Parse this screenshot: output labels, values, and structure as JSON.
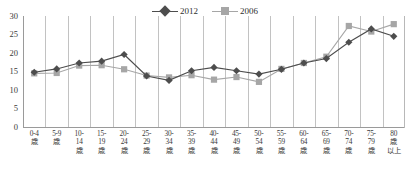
{
  "chart_data": {
    "type": "line",
    "title": "",
    "subtitle": "",
    "xlabel": "",
    "ylabel": "",
    "ylim": [
      0,
      30
    ],
    "yticks": [
      0,
      5,
      10,
      15,
      20,
      25,
      30
    ],
    "grid": "vertical",
    "legend_position": "top-center",
    "categories": [
      "0-4\n歳",
      "5-9\n歳",
      "10-\n14\n歳",
      "15-\n19\n歳",
      "20-\n24\n歳",
      "25-\n29\n歳",
      "30-\n34\n歳",
      "35-\n39\n歳",
      "40-\n44\n歳",
      "45-\n49\n歳",
      "50-\n54\n歳",
      "55-\n59\n歳",
      "60-\n64\n歳",
      "65-\n69\n歳",
      "70-\n74\n歳",
      "75-\n79\n歳",
      "80\n歳\n以上"
    ],
    "category_lines": [
      [
        "0-4",
        "歳"
      ],
      [
        "5-9",
        "歳"
      ],
      [
        "10-",
        "14",
        "歳"
      ],
      [
        "15-",
        "19",
        "歳"
      ],
      [
        "20-",
        "24",
        "歳"
      ],
      [
        "25-",
        "29",
        "歳"
      ],
      [
        "30-",
        "34",
        "歳"
      ],
      [
        "35-",
        "39",
        "歳"
      ],
      [
        "40-",
        "44",
        "歳"
      ],
      [
        "45-",
        "49",
        "歳"
      ],
      [
        "50-",
        "54",
        "歳"
      ],
      [
        "55-",
        "59",
        "歳"
      ],
      [
        "60-",
        "64",
        "歳"
      ],
      [
        "65-",
        "69",
        "歳"
      ],
      [
        "70-",
        "74",
        "歳"
      ],
      [
        "75-",
        "79",
        "歳"
      ],
      [
        "80",
        "歳",
        "以上"
      ]
    ],
    "series": [
      {
        "name": "2012",
        "color": "#4d4d4d",
        "marker": "diamond",
        "values": [
          14.8,
          15.7,
          17.3,
          17.8,
          19.6,
          13.8,
          12.6,
          15.2,
          16.1,
          15.2,
          14.3,
          15.6,
          17.3,
          18.5,
          22.9,
          26.5,
          24.5
        ]
      },
      {
        "name": "2006",
        "color": "#a6a6a6",
        "marker": "square",
        "values": [
          14.5,
          14.6,
          16.6,
          16.7,
          15.6,
          13.9,
          13.4,
          14.0,
          12.8,
          13.5,
          12.2,
          15.7,
          17.3,
          19.0,
          27.3,
          25.8,
          27.8
        ]
      }
    ]
  },
  "legend": {
    "items": [
      {
        "label": "2012",
        "marker": "diamond",
        "color": "#4d4d4d"
      },
      {
        "label": "2006",
        "marker": "square",
        "color": "#a6a6a6"
      }
    ]
  },
  "yaxis": {
    "ticks": [
      "30",
      "25",
      "20",
      "15",
      "10",
      "5",
      "0"
    ]
  },
  "colors": {
    "series_2012": "#4d4d4d",
    "series_2006": "#a6a6a6",
    "gridline": "#c2c2c2",
    "axis": "#9a9a9a",
    "text": "#3a3a3a",
    "background": "#ffffff"
  }
}
